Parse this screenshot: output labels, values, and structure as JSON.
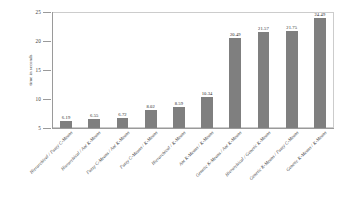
{
  "chart_data": {
    "type": "bar",
    "title": "",
    "xlabel": "",
    "ylabel": "time in seconds",
    "ylim": [
      5,
      25
    ],
    "yticks": [
      5,
      10,
      15,
      20,
      25
    ],
    "ytick_labels": [
      "5",
      "10",
      "15",
      "20",
      "25"
    ],
    "grid": false,
    "legend": null,
    "bar_color": "#7f7f7f",
    "categories": [
      "Hierarchical / Fuzzy C-Means",
      "Hierarchical / Ant K-Means",
      "Fuzzy C-Means / Ant K-Means",
      "Fuzzy C-Means / K-Means",
      "Hierarchical / K-Means",
      "Ant K-Means / K-Means",
      "Genetic K-Means / Ant K-Means",
      "Hierarchical / Genetic K-Means",
      "Genetic K-Means / Fuzzy C-Means",
      "Genetic K-Means / K-Means"
    ],
    "values": [
      6.19,
      6.55,
      6.72,
      8.02,
      8.59,
      10.34,
      20.49,
      21.57,
      21.75,
      24.49
    ],
    "value_labels": [
      "6.19",
      "6.55",
      "6.72",
      "8.02",
      "8.59",
      "10.34",
      "20.49",
      "21.57",
      "21.75",
      "24.49"
    ]
  }
}
